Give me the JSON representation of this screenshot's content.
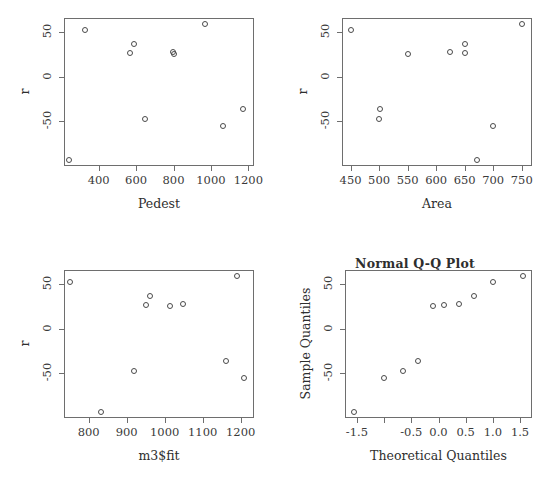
{
  "figure": {
    "background": "#ffffff",
    "point_color": "#4a4a4a",
    "axis_color": "#6e6e6e",
    "text_color": "#3a3a3a"
  },
  "panels": [
    {
      "id": "panel-pedest",
      "name": "residuals-vs-pedest",
      "title": "",
      "xlabel": "Pedest",
      "ylabel": "r"
    },
    {
      "id": "panel-area",
      "name": "residuals-vs-area",
      "title": "",
      "xlabel": "Area",
      "ylabel": "r"
    },
    {
      "id": "panel-fit",
      "name": "residuals-vs-fitted",
      "title": "",
      "xlabel": "m3$fit",
      "ylabel": "r"
    },
    {
      "id": "panel-qq",
      "name": "normal-qq-plot",
      "title": "Normal Q-Q Plot",
      "xlabel": "Theoretical Quantiles",
      "ylabel": "Sample Quantiles"
    }
  ],
  "chart_data": [
    {
      "type": "scatter",
      "panel": "residuals-vs-pedest",
      "title": "",
      "xlabel": "Pedest",
      "ylabel": "r",
      "xlim": [
        215,
        1230
      ],
      "ylim": [
        -100,
        66
      ],
      "xticks": [
        400,
        600,
        800,
        1000,
        1200
      ],
      "xticklabels": [
        "400",
        "600",
        "800",
        "1000",
        "1200"
      ],
      "yticks": [
        50,
        0,
        -50
      ],
      "yticklabels": [
        "50",
        "0",
        "-50"
      ],
      "grid": false,
      "legend": null,
      "marker": "open-circle",
      "x": [
        240,
        325,
        570,
        590,
        650,
        795,
        802,
        968,
        1065,
        1172
      ],
      "y": [
        -93,
        52,
        27,
        37,
        -47,
        28,
        26,
        59,
        -55,
        -36
      ]
    },
    {
      "type": "scatter",
      "panel": "residuals-vs-area",
      "title": "",
      "xlabel": "Area",
      "ylabel": "r",
      "xlim": [
        435,
        768
      ],
      "ylim": [
        -100,
        66
      ],
      "xticks": [
        450,
        500,
        550,
        600,
        650,
        700,
        750
      ],
      "xticklabels": [
        "450",
        "500",
        "550",
        "600",
        "650",
        "700",
        "750"
      ],
      "yticks": [
        50,
        0,
        -50
      ],
      "yticklabels": [
        "50",
        "0",
        "-50"
      ],
      "grid": false,
      "legend": null,
      "marker": "open-circle",
      "x": [
        450,
        499,
        501,
        551,
        624,
        650,
        651,
        672,
        700,
        750
      ],
      "y": [
        52,
        -47,
        -36,
        26,
        28,
        37,
        27,
        -93,
        -55,
        59
      ]
    },
    {
      "type": "scatter",
      "panel": "residuals-vs-fitted",
      "title": "",
      "xlabel": "m3$fit",
      "ylabel": "r",
      "xlim": [
        735,
        1235
      ],
      "ylim": [
        -100,
        66
      ],
      "xticks": [
        800,
        900,
        1000,
        1100,
        1200
      ],
      "xticklabels": [
        "800",
        "900",
        "1000",
        "1100",
        "1200"
      ],
      "yticks": [
        50,
        0,
        -50
      ],
      "yticklabels": [
        "50",
        "0",
        "-50"
      ],
      "grid": false,
      "legend": null,
      "marker": "open-circle",
      "x": [
        752,
        832,
        920,
        952,
        962,
        1014,
        1048,
        1162,
        1190,
        1208
      ],
      "y": [
        52,
        -93,
        -47,
        27,
        37,
        26,
        28,
        -36,
        59,
        -55
      ]
    },
    {
      "type": "scatter",
      "panel": "normal-qq-plot",
      "title": "Normal Q-Q Plot",
      "xlabel": "Theoretical Quantiles",
      "ylabel": "Sample Quantiles",
      "xlim": [
        -1.72,
        1.72
      ],
      "ylim": [
        -100,
        66
      ],
      "xticks": [
        -1.5,
        -1.0,
        -0.5,
        0.0,
        0.5,
        1.0,
        1.5
      ],
      "xticklabels": [
        "-1.5",
        "",
        "-0.5",
        "0.0",
        "0.5",
        "1.0",
        "1.5"
      ],
      "yticks": [
        50,
        0,
        -50
      ],
      "yticklabels": [
        "50",
        "0",
        "-50"
      ],
      "grid": false,
      "legend": null,
      "marker": "open-circle",
      "x": [
        -1.55,
        -1.0,
        -0.65,
        -0.37,
        -0.11,
        0.11,
        0.37,
        0.65,
        1.0,
        1.55
      ],
      "y": [
        -93,
        -55,
        -47,
        -36,
        26,
        27,
        28,
        37,
        52,
        59
      ]
    }
  ]
}
